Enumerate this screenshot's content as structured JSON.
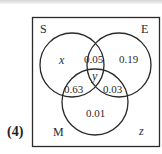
{
  "question_number": "(4)",
  "diagram": {
    "type": "venn-3-set",
    "universal_label": "z",
    "sets": [
      {
        "name": "S",
        "label": "S"
      },
      {
        "name": "E",
        "label": "E"
      },
      {
        "name": "M",
        "label": "M"
      }
    ],
    "regions": {
      "S_only": "x",
      "E_only": "0.19",
      "M_only": "0.01",
      "S_and_E_only": "0.05",
      "S_and_M_only": "0.63",
      "E_and_M_only": "0.03",
      "S_and_E_and_M": "y",
      "outside": "z"
    }
  },
  "colors": {
    "stroke": "#2a2a2a",
    "background": "#ffffff"
  }
}
